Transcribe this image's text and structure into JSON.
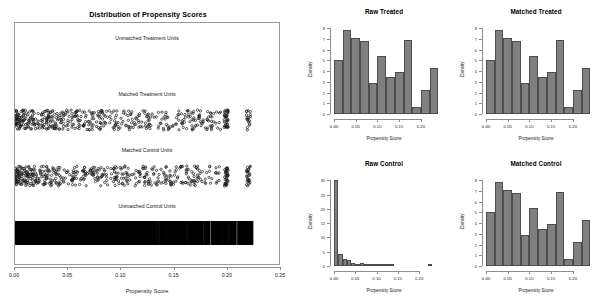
{
  "figure": {
    "kind": "propensity-score-diagnostics",
    "bar_fill_color": "#808080",
    "bar_border_color": "#4d4d4d",
    "axis_color": "#8d8d8d",
    "background_color": "#ffffff"
  },
  "left_panel": {
    "title": "Distribution of Propensity Scores",
    "xlabel": "Propensity Score",
    "xticks": [
      "0.00",
      "0.05",
      "0.10",
      "0.15",
      "0.20",
      "0.25"
    ],
    "xlim": [
      0.0,
      0.25
    ],
    "groups": [
      {
        "label": "Unmatched Treatment Units",
        "style": "empty"
      },
      {
        "label": "Matched Treatment Units",
        "style": "jitter"
      },
      {
        "label": "Matched Control Units",
        "style": "jitter"
      },
      {
        "label": "Unmatched Control Units",
        "style": "dense-strips"
      }
    ]
  },
  "chart_data": [
    {
      "id": "raw-treated",
      "type": "bar",
      "title": "Raw Treated",
      "xlabel": "Propensity Score",
      "ylabel": "Density",
      "xticks": [
        "0.00",
        "0.05",
        "0.10",
        "0.15",
        "0.20"
      ],
      "xtickvalues": [
        0.0,
        0.05,
        0.1,
        0.15,
        0.2
      ],
      "yticks": [
        "0",
        "1",
        "2",
        "3",
        "4",
        "5",
        "6",
        "7",
        "8"
      ],
      "ytickvalues": [
        0,
        1,
        2,
        3,
        4,
        5,
        6,
        7,
        8
      ],
      "xlim": [
        0.0,
        0.23
      ],
      "ylim": [
        0,
        8.4
      ],
      "bin_width": 0.02,
      "bin_edges": [
        0.0,
        0.02,
        0.04,
        0.06,
        0.08,
        0.1,
        0.12,
        0.14,
        0.16,
        0.18,
        0.2,
        0.22,
        0.24
      ],
      "categories": [
        "0.00-0.02",
        "0.02-0.04",
        "0.04-0.06",
        "0.06-0.08",
        "0.08-0.10",
        "0.10-0.12",
        "0.12-0.14",
        "0.14-0.16",
        "0.16-0.18",
        "0.18-0.20",
        "0.20-0.22",
        "0.22-0.24"
      ],
      "values": [
        5.0,
        7.8,
        7.1,
        6.8,
        2.9,
        5.4,
        3.5,
        3.9,
        6.9,
        0.7,
        2.2,
        4.3
      ]
    },
    {
      "id": "matched-treated",
      "type": "bar",
      "title": "Matched Treated",
      "xlabel": "Propensity Score",
      "ylabel": "Density",
      "xticks": [
        "0.00",
        "0.05",
        "0.10",
        "0.15",
        "0.20"
      ],
      "xtickvalues": [
        0.0,
        0.05,
        0.1,
        0.15,
        0.2
      ],
      "yticks": [
        "0",
        "1",
        "2",
        "3",
        "4",
        "5",
        "6",
        "7",
        "8"
      ],
      "ytickvalues": [
        0,
        1,
        2,
        3,
        4,
        5,
        6,
        7,
        8
      ],
      "xlim": [
        0.0,
        0.23
      ],
      "ylim": [
        0,
        8.4
      ],
      "bin_width": 0.02,
      "bin_edges": [
        0.0,
        0.02,
        0.04,
        0.06,
        0.08,
        0.1,
        0.12,
        0.14,
        0.16,
        0.18,
        0.2,
        0.22,
        0.24
      ],
      "categories": [
        "0.00-0.02",
        "0.02-0.04",
        "0.04-0.06",
        "0.06-0.08",
        "0.08-0.10",
        "0.10-0.12",
        "0.12-0.14",
        "0.14-0.16",
        "0.16-0.18",
        "0.18-0.20",
        "0.20-0.22",
        "0.22-0.24"
      ],
      "values": [
        5.0,
        7.8,
        7.1,
        6.8,
        2.9,
        5.4,
        3.5,
        3.9,
        6.9,
        0.7,
        2.2,
        4.3
      ]
    },
    {
      "id": "raw-control",
      "type": "bar",
      "title": "Raw Control",
      "xlabel": "Propensity Score",
      "ylabel": "Density",
      "xticks": [
        "0.00",
        "0.05",
        "0.10",
        "0.15",
        "0.20"
      ],
      "xtickvalues": [
        0.0,
        0.05,
        0.1,
        0.15,
        0.2
      ],
      "yticks": [
        "0",
        "5",
        "10",
        "15",
        "20",
        "25",
        "30"
      ],
      "ytickvalues": [
        0,
        5,
        10,
        15,
        20,
        25,
        30
      ],
      "xlim": [
        0.0,
        0.235
      ],
      "ylim": [
        0,
        31.5
      ],
      "bin_width": 0.01,
      "bin_edges": [
        0.0,
        0.01,
        0.02,
        0.03,
        0.04,
        0.05,
        0.06,
        0.07,
        0.08,
        0.09,
        0.1,
        0.11,
        0.12,
        0.13,
        0.14,
        0.15,
        0.16,
        0.17,
        0.18,
        0.19,
        0.2,
        0.21,
        0.22,
        0.23
      ],
      "categories": [
        "0.00-0.01",
        "0.01-0.02",
        "0.02-0.03",
        "0.03-0.04",
        "0.04-0.05",
        "0.05-0.06",
        "0.06-0.07",
        "0.07-0.08",
        "0.08-0.09",
        "0.09-0.10",
        "0.10-0.11",
        "0.11-0.12",
        "0.12-0.13",
        "0.13-0.14",
        "0.14-0.15",
        "0.15-0.16",
        "0.16-0.17",
        "0.17-0.18",
        "0.18-0.19",
        "0.19-0.20",
        "0.20-0.21",
        "0.21-0.22",
        "0.22-0.23"
      ],
      "values": [
        30.0,
        4.3,
        2.6,
        2.0,
        0.9,
        0.8,
        0.9,
        0.5,
        0.45,
        0.3,
        0.7,
        0.25,
        0.2,
        0.2,
        0.0,
        0.0,
        0.0,
        0.0,
        0.0,
        0.0,
        0.0,
        0.0,
        0.35
      ]
    },
    {
      "id": "matched-control",
      "type": "bar",
      "title": "Matched Control",
      "xlabel": "Propensity Score",
      "ylabel": "Density",
      "xticks": [
        "0.00",
        "0.05",
        "0.10",
        "0.15",
        "0.20"
      ],
      "xtickvalues": [
        0.0,
        0.05,
        0.1,
        0.15,
        0.2
      ],
      "yticks": [
        "0",
        "1",
        "2",
        "3",
        "4",
        "5",
        "6",
        "7",
        "8"
      ],
      "ytickvalues": [
        0,
        1,
        2,
        3,
        4,
        5,
        6,
        7,
        8
      ],
      "xlim": [
        0.0,
        0.23
      ],
      "ylim": [
        0,
        8.4
      ],
      "bin_width": 0.02,
      "bin_edges": [
        0.0,
        0.02,
        0.04,
        0.06,
        0.08,
        0.1,
        0.12,
        0.14,
        0.16,
        0.18,
        0.2,
        0.22,
        0.24
      ],
      "categories": [
        "0.00-0.02",
        "0.02-0.04",
        "0.04-0.06",
        "0.06-0.08",
        "0.08-0.10",
        "0.10-0.12",
        "0.12-0.14",
        "0.14-0.16",
        "0.16-0.18",
        "0.18-0.20",
        "0.20-0.22",
        "0.22-0.24"
      ],
      "values": [
        5.0,
        7.8,
        7.1,
        6.8,
        2.9,
        5.4,
        3.5,
        3.9,
        6.9,
        0.7,
        2.2,
        4.3
      ]
    }
  ]
}
